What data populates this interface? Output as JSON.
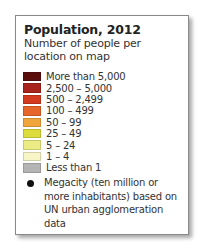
{
  "legend": {
    "title": "Population, 2012",
    "subtitle": "Number of people per location on map",
    "items": [
      {
        "label": "More than 5,000",
        "color": "#5a0e0c"
      },
      {
        "label": "2,500 – 5,000",
        "color": "#a8231b"
      },
      {
        "label": "500 – 2,499",
        "color": "#d33a1e"
      },
      {
        "label": "100 – 499",
        "color": "#e5652a"
      },
      {
        "label": "50 – 99",
        "color": "#f0a53a"
      },
      {
        "label": "25 – 49",
        "color": "#dcdc3c"
      },
      {
        "label": "5 – 24",
        "color": "#ecec84"
      },
      {
        "label": "1 – 4",
        "color": "#f7f5c6"
      },
      {
        "label": "Less than 1",
        "color": "#b4b4b4"
      }
    ],
    "megacity": {
      "symbol": "black-dot",
      "label": "Megacity (ten million or more inhabitants) based on UN urban agglomeration data"
    }
  }
}
